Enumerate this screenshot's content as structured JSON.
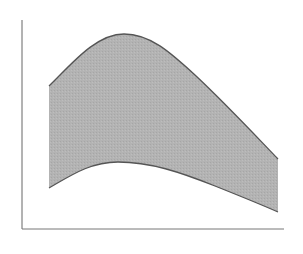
{
  "chart_data": {
    "type": "area",
    "subtype": "band",
    "title": "",
    "xlabel": "",
    "ylabel": "",
    "grid": false,
    "legend": null,
    "tick_labels": {
      "x": [],
      "y": []
    },
    "xlim": [
      0,
      1
    ],
    "ylim": [
      0,
      1
    ],
    "x": [
      0.0,
      0.1,
      0.2,
      0.3,
      0.4,
      0.5,
      0.6,
      0.7,
      0.8,
      0.9,
      1.0
    ],
    "series": [
      {
        "name": "upper",
        "values": [
          0.7,
          0.82,
          0.92,
          0.96,
          0.93,
          0.84,
          0.73,
          0.61,
          0.49,
          0.37,
          0.34
        ]
      },
      {
        "name": "lower",
        "values": [
          0.2,
          0.27,
          0.32,
          0.33,
          0.32,
          0.3,
          0.27,
          0.23,
          0.18,
          0.12,
          0.08
        ]
      }
    ],
    "colors": {
      "fill": "#b3b3b3",
      "stroke": "#555555",
      "axis": "#666666",
      "background": "#ffffff"
    }
  },
  "layout": {
    "axis_x": {
      "x1": 22,
      "x2": 284,
      "y": 229
    },
    "axis_y": {
      "x": 22,
      "y1": 20,
      "y2": 229
    },
    "upper_path": "M49,86 C70,66 95,34 124,34 C150,34 170,52 195,75 C225,103 252,132 278,159",
    "lower_path": "M49,188 C70,176 90,162 118,162 C150,162 180,172 215,186 C240,196 260,204 278,212"
  }
}
